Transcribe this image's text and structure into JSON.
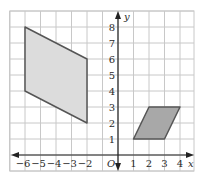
{
  "diagram": {
    "type": "coordinate-grid",
    "axes": {
      "x_label": "x",
      "y_label": "y",
      "origin_label": "O",
      "x_ticks": [
        "−6",
        "−5",
        "−4",
        "−3",
        "−2",
        "1",
        "2",
        "3",
        "4"
      ],
      "y_ticks": [
        "1",
        "2",
        "3",
        "4",
        "5",
        "6",
        "7",
        "8"
      ]
    },
    "grid": {
      "x_min": -7,
      "x_max": 4.9,
      "y_min": -1,
      "y_max": 9,
      "step": 1
    },
    "shapes": [
      {
        "name": "large-parallelogram",
        "vertices": [
          [
            -6,
            8
          ],
          [
            -2,
            6
          ],
          [
            -2,
            2
          ],
          [
            -6,
            4
          ]
        ],
        "fill": "#dcdcdc",
        "stroke": "#555555"
      },
      {
        "name": "small-parallelogram",
        "vertices": [
          [
            1,
            1
          ],
          [
            3,
            1
          ],
          [
            4,
            3
          ],
          [
            2,
            3
          ]
        ],
        "fill": "#a8a8a8",
        "stroke": "#555555"
      }
    ],
    "colors": {
      "grid": "#c8c8c8",
      "axis": "#222222"
    }
  }
}
